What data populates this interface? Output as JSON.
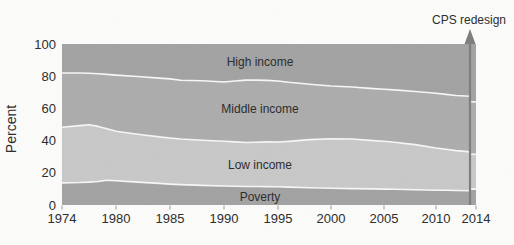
{
  "figure": {
    "ylabel": "Percent",
    "annotation_label": "CPS redesign"
  },
  "chart_data": {
    "type": "area",
    "stacked": true,
    "title": "",
    "xlabel": "",
    "ylabel": "Percent",
    "ylim": [
      0,
      100
    ],
    "yticks": [
      0,
      20,
      40,
      60,
      80,
      100
    ],
    "xticks": [
      1974,
      1980,
      1985,
      1990,
      1995,
      2000,
      2005,
      2010,
      2014
    ],
    "grid": false,
    "legend": "labels-inside-bands",
    "x": [
      1974,
      1976,
      1977,
      1978,
      1979,
      1980,
      1982,
      1984,
      1985,
      1986,
      1988,
      1990,
      1991,
      1992,
      1993,
      1994,
      1995,
      1996,
      1998,
      2000,
      2002,
      2004,
      2005,
      2006,
      2008,
      2010,
      2011,
      2012,
      2013.4,
      2013.4,
      2014
    ],
    "boundaries": {
      "poverty_top": [
        13.7,
        14.0,
        14.2,
        14.6,
        15.4,
        15.0,
        14.2,
        13.4,
        13.0,
        12.7,
        12.2,
        11.8,
        11.7,
        11.5,
        11.5,
        11.4,
        11.3,
        11.1,
        10.7,
        10.4,
        10.2,
        10.0,
        9.9,
        9.8,
        9.5,
        9.2,
        9.1,
        9.0,
        8.8,
        9.9,
        9.9
      ],
      "low_top": [
        48.3,
        49.3,
        49.9,
        48.8,
        47.3,
        45.8,
        44.0,
        42.3,
        41.6,
        41.0,
        40.2,
        39.6,
        39.2,
        38.8,
        39.0,
        39.2,
        39.1,
        39.5,
        40.6,
        41.2,
        41.0,
        40.0,
        39.6,
        39.0,
        37.5,
        35.4,
        34.6,
        33.8,
        33.0,
        31.5,
        31.5
      ],
      "middle_top": [
        82.0,
        82.0,
        81.8,
        81.5,
        81.1,
        80.7,
        79.8,
        78.8,
        78.3,
        77.5,
        77.2,
        76.4,
        77.0,
        77.6,
        77.6,
        77.4,
        77.0,
        76.2,
        75.0,
        73.9,
        73.3,
        72.3,
        71.9,
        71.5,
        70.5,
        69.4,
        68.7,
        68.0,
        67.5,
        64.2,
        64.0
      ]
    },
    "bands": [
      {
        "name": "Poverty",
        "color": "#a2a2a2",
        "label_y_percent": 5.0
      },
      {
        "name": "Low income",
        "color": "#c8c8c8",
        "label_y_percent": 25.2
      },
      {
        "name": "Middle income",
        "color": "#acacac",
        "label_y_percent": 59.6
      },
      {
        "name": "High income",
        "color": "#a2a2a2",
        "label_y_percent": 88.8
      }
    ],
    "annotation": {
      "label": "CPS redesign",
      "year": 2013.4
    },
    "colors": {
      "boundary_line": "#f7f7f7",
      "arrow": "#7d7d7d",
      "text": "#2a2a2a",
      "tick": "#9a9a9a"
    }
  }
}
